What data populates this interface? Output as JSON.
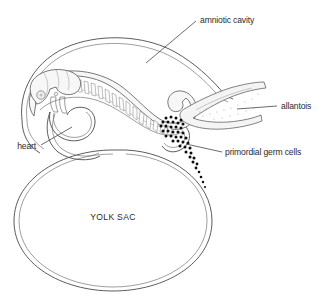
{
  "figure": {
    "background_color": "#ffffff",
    "line_color": "#4a4a4a",
    "text_color": "#2b2b2b",
    "germ_cell_color": "#0d0d0d"
  },
  "labels": {
    "amniotic_cavity": "amniotic cavity",
    "allantois": "allantois",
    "primordial_germ_cells": "primordial germ cells",
    "heart": "heart",
    "yolk_sac": "YOLK SAC"
  },
  "structures": [
    {
      "name": "amniotic-cavity",
      "label": "amniotic cavity",
      "leader": true
    },
    {
      "name": "allantois",
      "label": "allantois",
      "leader": true
    },
    {
      "name": "primordial-germ-cells",
      "label": "primordial germ cells",
      "leader": true
    },
    {
      "name": "heart",
      "label": "heart",
      "leader": true
    },
    {
      "name": "yolk-sac",
      "label": "YOLK SAC",
      "leader": false
    }
  ]
}
